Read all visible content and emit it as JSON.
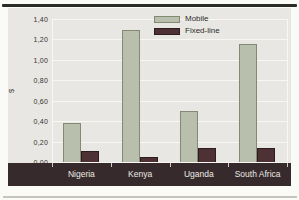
{
  "chart_data": {
    "type": "bar",
    "title": "",
    "categories": [
      "Nigeria",
      "Kenya",
      "Uganda",
      "South Africa"
    ],
    "series": [
      {
        "name": "Mobile",
        "color": "#b8bfac",
        "border_color": "#828a74",
        "values": [
          0.38,
          1.29,
          0.5,
          1.16
        ]
      },
      {
        "name": "Fixed-line",
        "color": "#4d3134",
        "border_color": "#2e1d1f",
        "values": [
          0.11,
          0.05,
          0.14,
          0.14
        ]
      }
    ],
    "xlabel": "",
    "ylabel": "$",
    "ylim": [
      0,
      1.4
    ],
    "yticks": [
      {
        "label": "0,00",
        "value": 0.0
      },
      {
        "label": "0,20",
        "value": 0.2
      },
      {
        "label": "0,40",
        "value": 0.4
      },
      {
        "label": "0,60",
        "value": 0.6
      },
      {
        "label": "0,80",
        "value": 0.8
      },
      {
        "label": "1,00",
        "value": 1.0
      },
      {
        "label": "1,20",
        "value": 1.2
      },
      {
        "label": "1,40",
        "value": 1.4
      }
    ],
    "grid": true,
    "legend_position": "top-center",
    "decimal_separator": ","
  },
  "colors": {
    "page_bg": "#fafaf7",
    "chart_bg": "#e9e7e3",
    "gridline": "#f8f7f4",
    "axis_band_bg": "#362a2c",
    "axis_band_tick": "#cfccc6",
    "axis_band_text": "#ece9e4",
    "tick_text": "#35322e",
    "legend_text": "#2d2b28",
    "top_rule": "#2b2a28",
    "bottom_rule": "#c7c4be"
  }
}
